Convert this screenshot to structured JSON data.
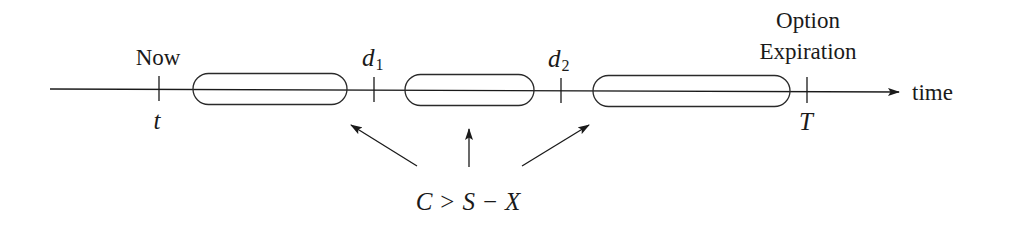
{
  "diagram": {
    "type": "timeline",
    "axis": {
      "label": "time",
      "x_start": 50,
      "x_end": 900,
      "y": 90
    },
    "markers": [
      {
        "id": "now",
        "x": 159,
        "above_label": "Now",
        "below_label": "t"
      },
      {
        "id": "d1",
        "x": 374,
        "above_label_main": "d",
        "above_label_sub": "1"
      },
      {
        "id": "d2",
        "x": 561,
        "above_label_main": "d",
        "above_label_sub": "2"
      },
      {
        "id": "expiration",
        "x": 807,
        "above_label_line1": "Option",
        "above_label_line2": "Expiration",
        "below_label": "T"
      }
    ],
    "intervals": [
      {
        "id": "interval-1",
        "x1": 193,
        "x2": 347
      },
      {
        "id": "interval-2",
        "x1": 405,
        "x2": 534
      },
      {
        "id": "interval-3",
        "x1": 593,
        "x2": 790
      }
    ],
    "condition": {
      "label_parts": [
        "C",
        ">",
        "S",
        "−",
        "X"
      ],
      "text": "C > S − X"
    }
  }
}
